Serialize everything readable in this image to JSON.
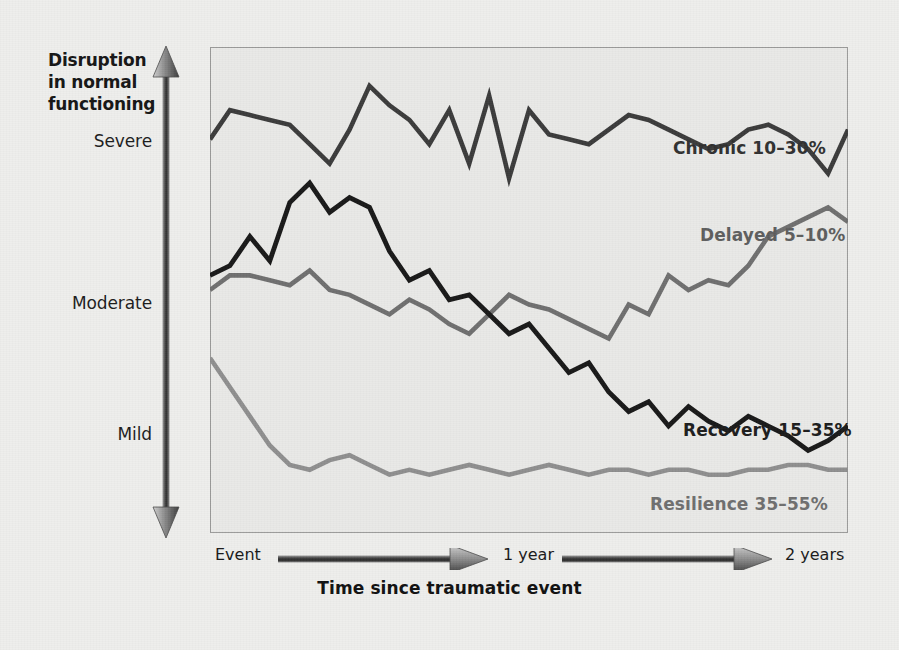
{
  "figure": {
    "y_axis": {
      "caption_lines": [
        "Disruption",
        "in normal",
        "functioning"
      ],
      "ticks": [
        "Severe",
        "Moderate",
        "Mild"
      ],
      "arrow_icon": "double-headed-vertical-arrow-icon"
    },
    "x_axis": {
      "ticks": [
        "Event",
        "1 year",
        "2 years"
      ],
      "arrow_icon": "right-arrow-icon"
    },
    "title": "Time since traumatic event",
    "series_labels": {
      "chronic": "Chronic 10–30%",
      "delayed": "Delayed 5–10%",
      "recovery": "Recovery 15–35%",
      "resilience": "Resilience 35–55%"
    },
    "colors": {
      "background": "#eeeeec",
      "plot_background": "#e9e9e7",
      "frame": "#9a9a99",
      "chronic": "#3a3a3a",
      "delayed": "#6e6e6e",
      "recovery": "#171717",
      "resilience": "#8e8e8e",
      "axis_arrow": "#5a5a5a"
    }
  },
  "chart_data": {
    "type": "line",
    "title": "Time since traumatic event",
    "xlabel": "Time since traumatic event",
    "ylabel": "Disruption in normal functioning",
    "grid": false,
    "legend": "inline-right-end-labels",
    "xlim": [
      0,
      24
    ],
    "ylim": [
      0,
      100
    ],
    "xtick_labels": [
      "Event",
      "1 year",
      "2 years"
    ],
    "xtick_values": [
      0,
      12,
      24
    ],
    "ytick_labels": [
      "Mild",
      "Moderate",
      "Severe"
    ],
    "ytick_values": [
      22,
      50,
      82
    ],
    "x": [
      0,
      0.75,
      1.5,
      2.25,
      3,
      3.75,
      4.5,
      5.25,
      6,
      6.75,
      7.5,
      8.25,
      9,
      9.75,
      10.5,
      11.25,
      12,
      12.75,
      13.5,
      14.25,
      15,
      15.75,
      16.5,
      17.25,
      18,
      18.75,
      19.5,
      20.25,
      21,
      21.75,
      22.5,
      23.25,
      24
    ],
    "series": [
      {
        "name": "Chronic 10–30%",
        "color": "#3a3a3a",
        "values": [
          81,
          87,
          86,
          85,
          84,
          80,
          76,
          83,
          92,
          88,
          85,
          80,
          87,
          76,
          90,
          73,
          87,
          82,
          81,
          80,
          83,
          86,
          85,
          83,
          81,
          79,
          80,
          83,
          84,
          82,
          79,
          74,
          83
        ]
      },
      {
        "name": "Delayed 5–10%",
        "color": "#6e6e6e",
        "values": [
          50,
          53,
          53,
          52,
          51,
          54,
          50,
          49,
          47,
          45,
          48,
          46,
          43,
          41,
          45,
          49,
          47,
          46,
          44,
          42,
          40,
          47,
          45,
          53,
          50,
          52,
          51,
          55,
          61,
          63,
          65,
          67,
          64
        ]
      },
      {
        "name": "Recovery 15–35%",
        "color": "#171717",
        "values": [
          53,
          55,
          61,
          56,
          68,
          72,
          66,
          69,
          67,
          58,
          52,
          54,
          48,
          49,
          45,
          41,
          43,
          38,
          33,
          35,
          29,
          25,
          27,
          22,
          26,
          23,
          21,
          24,
          22,
          20,
          17,
          19,
          22
        ]
      },
      {
        "name": "Resilience 35–55%",
        "color": "#8e8e8e",
        "values": [
          36,
          30,
          24,
          18,
          14,
          13,
          15,
          16,
          14,
          12,
          13,
          12,
          13,
          14,
          13,
          12,
          13,
          14,
          13,
          12,
          13,
          13,
          12,
          13,
          13,
          12,
          12,
          13,
          13,
          14,
          14,
          13,
          13
        ]
      }
    ]
  }
}
